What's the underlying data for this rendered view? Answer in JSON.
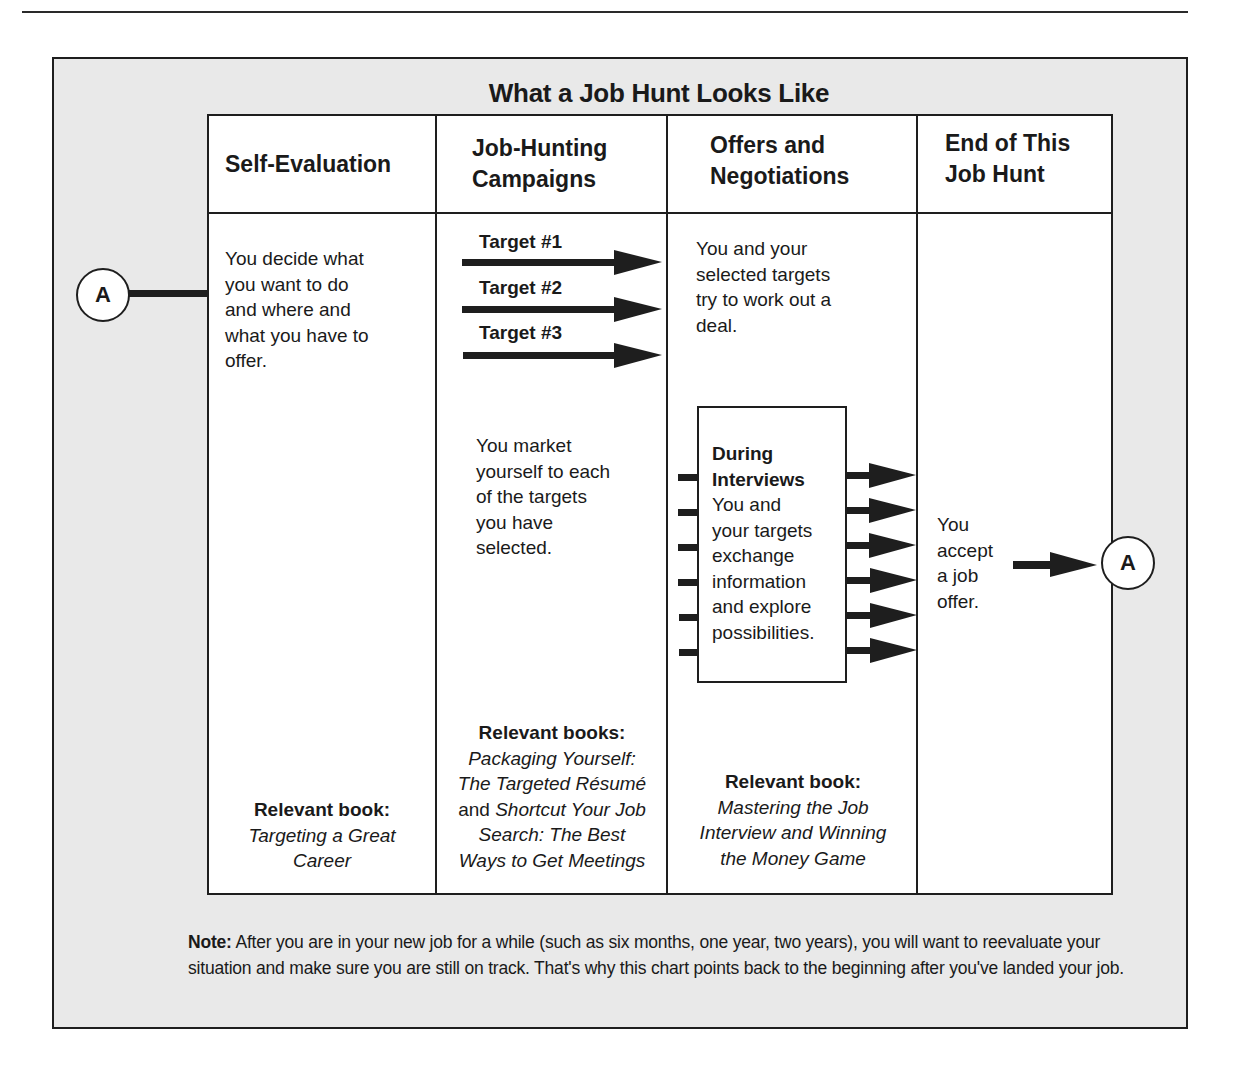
{
  "page": {
    "header_rule": true
  },
  "diagram": {
    "title": "What a Job Hunt Looks Like",
    "connector_label": "A",
    "columns": [
      {
        "heading_lines": [
          "Self-Evaluation"
        ],
        "description_lines": [
          "You decide what",
          "you want to do",
          "and where and",
          "what you have to",
          "offer."
        ],
        "book_label": "Relevant book:",
        "book_lines": [
          "Targeting a Great",
          "Career"
        ]
      },
      {
        "heading_lines": [
          "Job-Hunting",
          "Campaigns"
        ],
        "targets": [
          "Target #1",
          "Target #2",
          "Target #3"
        ],
        "description_lines": [
          "You market",
          "yourself to each",
          "of the targets",
          "you have",
          "selected."
        ],
        "book_label": "Relevant books:",
        "book_lines": [
          {
            "italic": "Packaging Yourself:"
          },
          {
            "italic": "The Targeted Résumé"
          },
          {
            "normal": "and ",
            "italic": "Shortcut Your Job"
          },
          {
            "italic": "Search: The Best"
          },
          {
            "italic": "Ways to Get Meetings"
          }
        ]
      },
      {
        "heading_lines": [
          "Offers and",
          "Negotiations"
        ],
        "description_lines": [
          "You and your",
          "selected targets",
          "try to work out a",
          "deal."
        ],
        "interview_box": {
          "heading_lines": [
            "During",
            "Interviews"
          ],
          "body_lines": [
            "You and",
            "your targets",
            "exchange",
            "information",
            "and explore",
            "possibilities."
          ],
          "inbound_arrows": 6,
          "outbound_arrows": 6
        },
        "book_label": "Relevant book:",
        "book_lines": [
          "Mastering the Job",
          "Interview and Winning",
          "the Money Game"
        ]
      },
      {
        "heading_lines": [
          "End of This",
          "Job Hunt"
        ],
        "description_lines": [
          "You",
          "accept",
          "a job",
          "offer."
        ]
      }
    ],
    "note": {
      "label": "Note:",
      "text": " After you are in your new job for a while (such as six months, one year, two years), you will want to reevaluate your situation and make sure you are still on track. That's why this chart points back to the beginning after you've landed your job."
    },
    "colors": {
      "panel_background": "#e9e9e9",
      "table_background": "#ffffff",
      "line": "#1e1e1e"
    }
  }
}
